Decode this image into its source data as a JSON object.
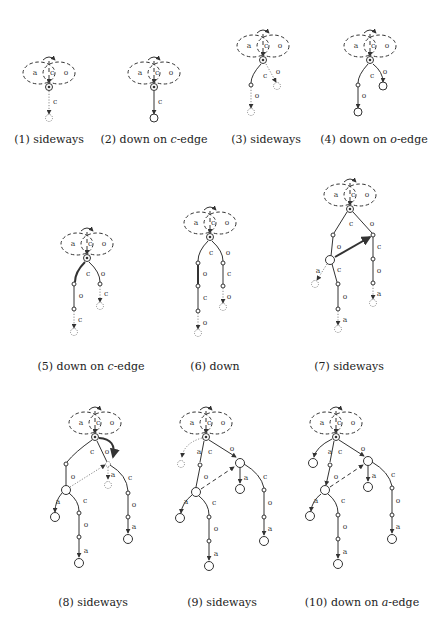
{
  "figure": {
    "edge_labels": {
      "a": "a",
      "c": "c",
      "o": "o"
    },
    "panels": [
      {
        "id": 1,
        "caption_num": "(1)",
        "caption_text": "sideways",
        "root": [
          49,
          87
        ]
      },
      {
        "id": 2,
        "caption_num": "(2)",
        "caption_text": "down on ",
        "caption_edge": "c",
        "caption_suffix": "-edge",
        "root": [
          154,
          87
        ]
      },
      {
        "id": 3,
        "caption_num": "(3)",
        "caption_text": "sideways",
        "root": [
          263,
          60
        ]
      },
      {
        "id": 4,
        "caption_num": "(4)",
        "caption_text": "down on ",
        "caption_edge": "o",
        "caption_suffix": "-edge",
        "root": [
          370,
          60
        ]
      },
      {
        "id": 5,
        "caption_num": "(5)",
        "caption_text": "down on ",
        "caption_edge": "c",
        "caption_suffix": "-edge",
        "root": [
          87,
          258
        ]
      },
      {
        "id": 6,
        "caption_num": "(6)",
        "caption_text": "down",
        "root": [
          210,
          237
        ]
      },
      {
        "id": 7,
        "caption_num": "(7)",
        "caption_text": "sideways",
        "root": [
          350,
          209
        ]
      },
      {
        "id": 8,
        "caption_num": "(8)",
        "caption_text": "sideways",
        "root": [
          95,
          437
        ]
      },
      {
        "id": 9,
        "caption_num": "(9)",
        "caption_text": "sideways",
        "root": [
          206,
          437
        ]
      },
      {
        "id": 10,
        "caption_num": "(10)",
        "caption_text": "down on ",
        "caption_edge": "a",
        "caption_suffix": "-edge",
        "root": [
          336,
          437
        ]
      }
    ]
  },
  "colors": {
    "stroke": "#333333",
    "dotted": "#777777",
    "background": "#ffffff"
  }
}
